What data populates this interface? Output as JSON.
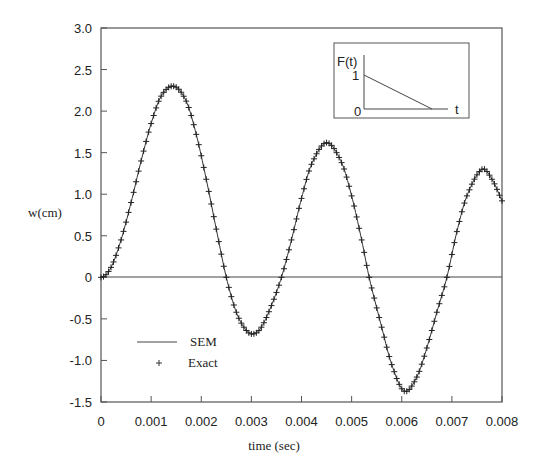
{
  "chart_data": {
    "type": "line",
    "title": "",
    "xlabel": "time (sec)",
    "ylabel": "w(cm)",
    "xlim": [
      0,
      0.008
    ],
    "ylim": [
      -1.5,
      3.0
    ],
    "grid": false,
    "x_ticks": [
      "0",
      "0.001",
      "0.002",
      "0.003",
      "0.004",
      "0.005",
      "0.006",
      "0.007",
      "0.008"
    ],
    "y_ticks": [
      "3.0",
      "2.5",
      "2.0",
      "1.5",
      "1.0",
      "0.5",
      "0",
      "-0.5",
      "-1.0",
      "-1.5"
    ],
    "legend": {
      "position": "lower-left",
      "entries": [
        {
          "label": "SEM",
          "style": "solid-line"
        },
        {
          "label": "Exact",
          "style": "plus-marker"
        }
      ]
    },
    "series": [
      {
        "name": "SEM",
        "style": "line",
        "x": [
          0,
          0.0002,
          0.0004,
          0.0006,
          0.0008,
          0.001,
          0.0012,
          0.00145,
          0.0017,
          0.0019,
          0.0021,
          0.0023,
          0.0025,
          0.0027,
          0.0029,
          0.00305,
          0.0032,
          0.0034,
          0.0036,
          0.0038,
          0.004,
          0.0042,
          0.0045,
          0.0048,
          0.005,
          0.0052,
          0.00535,
          0.0056,
          0.0058,
          0.00605,
          0.0063,
          0.0065,
          0.0067,
          0.0069,
          0.0071,
          0.0073,
          0.0076,
          0.0078,
          0.008
        ],
        "y": [
          0,
          0.12,
          0.45,
          0.9,
          1.4,
          1.85,
          2.18,
          2.3,
          2.12,
          1.72,
          1.18,
          0.58,
          0.0,
          -0.42,
          -0.64,
          -0.68,
          -0.6,
          -0.34,
          0.0,
          0.45,
          0.95,
          1.36,
          1.62,
          1.38,
          0.98,
          0.45,
          0.0,
          -0.6,
          -1.05,
          -1.37,
          -1.2,
          -0.85,
          -0.42,
          0.0,
          0.55,
          0.98,
          1.3,
          1.18,
          0.92
        ]
      },
      {
        "name": "Exact",
        "style": "plus-markers",
        "sampling_step": 5e-05,
        "same_curve_as": "SEM"
      }
    ],
    "inset": {
      "title": "F(t)",
      "y_tick": "1",
      "origin_label": "0",
      "x_label": "t",
      "description": "linearly decreasing load from 1 to 0"
    }
  }
}
